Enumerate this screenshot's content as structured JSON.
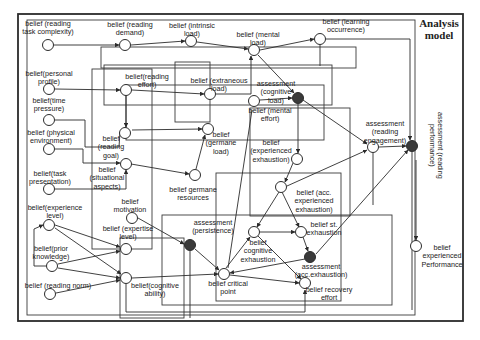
{
  "diagram": {
    "title": "Analysis\nmodel",
    "colors": {
      "line": "#2b2b2b",
      "node_fill_open": "#ffffff",
      "node_fill_assessment": "#3a3a3a",
      "background": "#ffffff"
    },
    "nodes": [
      {
        "id": "task_complexity",
        "label": "belief (reading\ntask complexity)",
        "type": "belief",
        "x": 48,
        "y": 45,
        "lx": 48,
        "ly": 20
      },
      {
        "id": "reading_demand",
        "label": "belief (reading\ndemand)",
        "type": "belief",
        "x": 125,
        "y": 45,
        "lx": 130,
        "ly": 21
      },
      {
        "id": "intrinsic_load",
        "label": "belief (intrinsic\nload)",
        "type": "belief",
        "x": 191,
        "y": 41,
        "lx": 192,
        "ly": 22
      },
      {
        "id": "mental_load",
        "label": "belief (mental\nload)",
        "type": "belief",
        "x": 254,
        "y": 50,
        "lx": 258,
        "ly": 31
      },
      {
        "id": "learning_occurrence",
        "label": "belief (learning\noccurrence)",
        "type": "belief",
        "x": 320,
        "y": 39,
        "lx": 346,
        "ly": 18
      },
      {
        "id": "personal_profile",
        "label": "belief(personal\nprofile)",
        "type": "belief",
        "x": 49,
        "y": 89,
        "lx": 49,
        "ly": 70
      },
      {
        "id": "reading_effort",
        "label": "belief(reading\neffort)",
        "type": "belief",
        "x": 126,
        "y": 90,
        "lx": 147,
        "ly": 73
      },
      {
        "id": "extraneous_load",
        "label": "belief (extraneous\nload)",
        "type": "belief",
        "x": 210,
        "y": 94,
        "lx": 219,
        "ly": 77
      },
      {
        "id": "cognitive_load",
        "label": "assessment\n(cognitive\nload)",
        "type": "assessment",
        "x": 298,
        "y": 98,
        "lx": 276,
        "ly": 80
      },
      {
        "id": "mental_effort",
        "label": "belief (mental\neffort)",
        "type": "belief",
        "x": 254,
        "y": 101,
        "lx": 270,
        "ly": 107
      },
      {
        "id": "time_pressure",
        "label": "belief(time\npressure)",
        "type": "belief",
        "x": 49,
        "y": 120,
        "lx": 49,
        "ly": 97
      },
      {
        "id": "germane_load",
        "label": "belief\n(germane\nload)",
        "type": "belief",
        "x": 208,
        "y": 129,
        "lx": 221,
        "ly": 131
      },
      {
        "id": "reading_goal",
        "label": "belief\n(reading\ngoal)",
        "type": "belief",
        "x": 125,
        "y": 133,
        "lx": 111,
        "ly": 135
      },
      {
        "id": "physical_env",
        "label": "belief (physical\nenvironment)",
        "type": "belief",
        "x": 49,
        "y": 149,
        "lx": 51,
        "ly": 129
      },
      {
        "id": "situational",
        "label": "belief\n(situational\naspects)",
        "type": "belief",
        "x": 126,
        "y": 164,
        "lx": 107,
        "ly": 166
      },
      {
        "id": "exp_exhaustion",
        "label": "belief\n(experienced\nexhaustion)",
        "type": "belief",
        "x": 297,
        "y": 159,
        "lx": 271,
        "ly": 139
      },
      {
        "id": "reading_engagement",
        "label": "assessment\n(reading\nengagement)",
        "type": "belief",
        "x": 373,
        "y": 147,
        "lx": 385,
        "ly": 120
      },
      {
        "id": "reading_performance",
        "label": "assessment (reading\nperformance)",
        "type": "assessment",
        "x": 412,
        "y": 146,
        "lx": 436,
        "ly": 112
      },
      {
        "id": "acc_exp_exhaustion",
        "label": "belief (acc.\nexperienced\nexhaustion)",
        "type": "belief",
        "x": 281,
        "y": 187,
        "lx": 314,
        "ly": 189
      },
      {
        "id": "germane_resources",
        "label": "belief germane\nresources",
        "type": "belief",
        "x": 195,
        "y": 175,
        "lx": 193,
        "ly": 186
      },
      {
        "id": "task_presentation",
        "label": "belief(task\npresentation)",
        "type": "belief",
        "x": 49,
        "y": 189,
        "lx": 50,
        "ly": 170
      },
      {
        "id": "motivation",
        "label": "belief\nmotivation",
        "type": "belief",
        "x": 132,
        "y": 218,
        "lx": 130,
        "ly": 198
      },
      {
        "id": "experience_level",
        "label": "belief(experience\nlevel)",
        "type": "belief",
        "x": 49,
        "y": 225,
        "lx": 55,
        "ly": 204
      },
      {
        "id": "persistence",
        "label": "assessment\n(persistence)",
        "type": "assessment",
        "x": 190,
        "y": 245,
        "lx": 213,
        "ly": 219
      },
      {
        "id": "cognitive_exhaustion",
        "label": "belief\ncognitive\nexhaustion",
        "type": "belief",
        "x": 254,
        "y": 232,
        "lx": 258,
        "ly": 239
      },
      {
        "id": "st_exhaustion",
        "label": "belief st.\nexhaustion",
        "type": "belief",
        "x": 301,
        "y": 232,
        "lx": 324,
        "ly": 221
      },
      {
        "id": "expertise_level",
        "label": "belief (expertise\nlevel)",
        "type": "belief",
        "x": 126,
        "y": 249,
        "lx": 128,
        "ly": 225
      },
      {
        "id": "exp_performance",
        "label": "belief\nexperienced\nPerformance",
        "type": "belief",
        "x": 416,
        "y": 246,
        "lx": 442,
        "ly": 244
      },
      {
        "id": "prior_knowledge",
        "label": "belief(prior\nknowledge)",
        "type": "belief",
        "x": 52,
        "y": 266,
        "lx": 51,
        "ly": 245
      },
      {
        "id": "acc_exhaustion",
        "label": "assessment\n(acc.exhaustion)",
        "type": "assessment",
        "x": 310,
        "y": 257,
        "lx": 321,
        "ly": 263
      },
      {
        "id": "critical_point",
        "label": "belief critical\npoint",
        "type": "belief",
        "x": 224,
        "y": 274,
        "lx": 228,
        "ly": 280
      },
      {
        "id": "cognitive_ability",
        "label": "belief(cognitive\nability)",
        "type": "belief",
        "x": 126,
        "y": 278,
        "lx": 155,
        "ly": 282
      },
      {
        "id": "recovery_effort",
        "label": "belief recovery\neffort",
        "type": "belief",
        "x": 305,
        "y": 283,
        "lx": 329,
        "ly": 286
      },
      {
        "id": "reading_norm",
        "label": "belief (reading norm)",
        "type": "belief",
        "x": 50,
        "y": 294,
        "lx": 58,
        "ly": 282
      }
    ]
  }
}
